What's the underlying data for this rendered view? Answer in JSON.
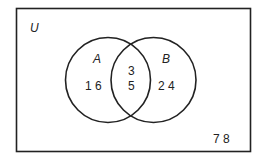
{
  "diagram": {
    "type": "venn",
    "universe": {
      "label": "U",
      "elements_outside": [
        "7",
        "8"
      ]
    },
    "sets": [
      {
        "label": "A",
        "only_elements": [
          "1",
          "6"
        ]
      },
      {
        "label": "B",
        "only_elements": [
          "2",
          "4"
        ]
      }
    ],
    "intersection": {
      "elements": [
        "3",
        "5"
      ]
    },
    "text": {
      "u_label": "U",
      "a_label": "A",
      "b_label": "B",
      "a_only": "1 6",
      "b_only": "2 4",
      "inter_top": "3",
      "inter_bottom": "5",
      "outside": "7 8"
    },
    "colors": {
      "stroke": "#222222",
      "background": "#ffffff"
    }
  }
}
